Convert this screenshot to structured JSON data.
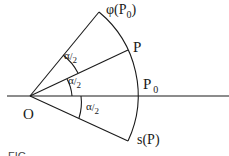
{
  "diagram": {
    "type": "geometric-construction",
    "points": {
      "origin": {
        "label": "O"
      },
      "phi_p0": {
        "label": "φ(P",
        "sub": "0",
        "close": ")"
      },
      "p": {
        "label": "P"
      },
      "p0": {
        "label": "P",
        "sub": "0"
      },
      "s_p": {
        "label": "s(P)"
      }
    },
    "angles": [
      {
        "name": "angle-phi-p0-to-p",
        "num": "α",
        "den": "2"
      },
      {
        "name": "angle-p-to-p0",
        "num": "α",
        "den": "2"
      },
      {
        "name": "angle-p0-to-s-p",
        "num": "α",
        "den": "2"
      }
    ],
    "caption_fragment": "FIG"
  }
}
